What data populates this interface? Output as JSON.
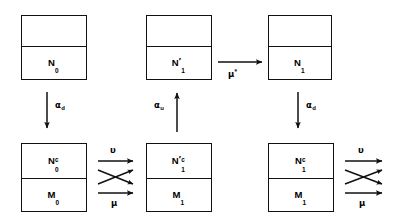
{
  "diagram": {
    "ink_color": "#111111",
    "background_color": "#ffffff",
    "boxes": [
      {
        "id": "box-top-left",
        "row": "top",
        "column": 1,
        "top_compartment": "",
        "bottom_compartment": {
          "base": "N",
          "prime": "",
          "sub": "0",
          "sup": ""
        },
        "bottom_label_text": "N0"
      },
      {
        "id": "box-top-middle",
        "row": "top",
        "column": 2,
        "top_compartment": "",
        "bottom_compartment": {
          "base": "N",
          "prime": "′",
          "sub": "1",
          "sup": ""
        },
        "bottom_label_text": "N'1"
      },
      {
        "id": "box-top-right",
        "row": "top",
        "column": 3,
        "top_compartment": "",
        "bottom_compartment": {
          "base": "N",
          "prime": "",
          "sub": "1",
          "sup": ""
        },
        "bottom_label_text": "N1"
      },
      {
        "id": "box-bottom-left",
        "row": "bottom",
        "column": 1,
        "top_compartment": {
          "base": "N",
          "prime": "",
          "sub": "0",
          "sup": "c"
        },
        "bottom_compartment": {
          "base": "M",
          "prime": "",
          "sub": "0",
          "sup": ""
        },
        "top_label_text": "N0c",
        "bottom_label_text": "M0"
      },
      {
        "id": "box-bottom-middle",
        "row": "bottom",
        "column": 2,
        "top_compartment": {
          "base": "N",
          "prime": "′",
          "sub": "1",
          "sup": "c"
        },
        "bottom_compartment": {
          "base": "M",
          "prime": "",
          "sub": "1",
          "sup": ""
        },
        "top_label_text": "N'1c",
        "bottom_label_text": "M1"
      },
      {
        "id": "box-bottom-right",
        "row": "bottom",
        "column": 3,
        "top_compartment": {
          "base": "N",
          "prime": "",
          "sub": "1",
          "sup": "c"
        },
        "bottom_compartment": {
          "base": "M",
          "prime": "",
          "sub": "1",
          "sup": ""
        },
        "top_label_text": "N1c",
        "bottom_label_text": "M1"
      }
    ],
    "arrow_labels": {
      "alpha_d_left": {
        "symbol": "α",
        "sub": "d",
        "sup": "",
        "direction": "down"
      },
      "alpha_u_mid": {
        "symbol": "α",
        "sub": "u",
        "sup": "",
        "direction": "up"
      },
      "alpha_d_right": {
        "symbol": "α",
        "sub": "d",
        "sup": "",
        "direction": "down"
      },
      "mu_star": {
        "symbol": "μ",
        "sub": "",
        "sup": "*",
        "direction": "right"
      },
      "upsilon_left": {
        "symbol": "υ",
        "sub": "",
        "sup": "",
        "direction": "right"
      },
      "mu_left": {
        "symbol": "μ",
        "sub": "",
        "sup": "",
        "direction": "right"
      },
      "upsilon_right": {
        "symbol": "υ",
        "sub": "",
        "sup": "",
        "direction": "right"
      },
      "mu_right": {
        "symbol": "μ",
        "sub": "",
        "sup": "",
        "direction": "right"
      }
    }
  }
}
